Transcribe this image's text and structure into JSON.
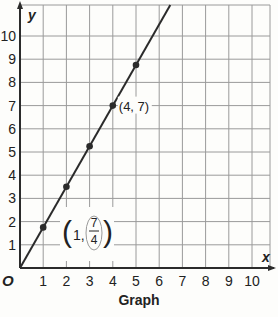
{
  "chart_data": {
    "type": "line",
    "title": "Graph",
    "xlabel": "x",
    "ylabel": "y",
    "origin_label": "O",
    "xlim": [
      0,
      10
    ],
    "ylim": [
      0,
      10
    ],
    "x_ticks": [
      1,
      2,
      3,
      4,
      5,
      6,
      7,
      8,
      9,
      10
    ],
    "y_ticks": [
      1,
      2,
      3,
      4,
      5,
      6,
      7,
      8,
      9,
      10
    ],
    "grid": true,
    "series": [
      {
        "name": "y = 7/4 x",
        "x": [
          0,
          1,
          2,
          3,
          4,
          5
        ],
        "y": [
          0,
          1.75,
          3.5,
          5.25,
          7,
          8.75
        ],
        "points": [
          [
            1,
            1.75
          ],
          [
            2,
            3.5
          ],
          [
            3,
            5.25
          ],
          [
            4,
            7
          ],
          [
            5,
            8.75
          ]
        ]
      }
    ],
    "annotations": [
      {
        "text": "(4, 7)",
        "x": 4,
        "y": 7
      },
      {
        "text": "(1, 7/4)",
        "x": 1,
        "y": 1.75,
        "numerator": "7",
        "denominator": "4",
        "prefix": "1,"
      }
    ]
  },
  "colors": {
    "line": "#2b2b2b",
    "grid": "#9a9a9a",
    "text": "#222222",
    "background": "#fdfdfb"
  }
}
